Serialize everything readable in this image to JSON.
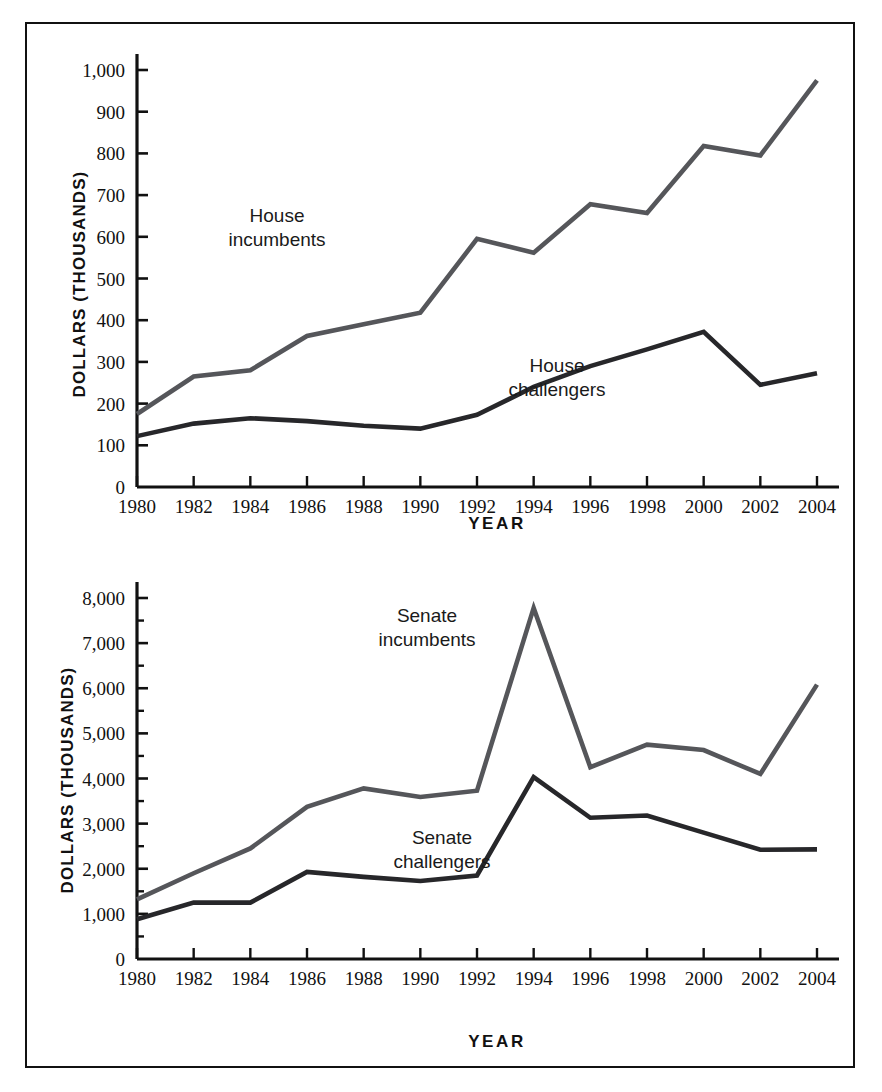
{
  "figure": {
    "background_color": "#ffffff",
    "frame_color": "#111111",
    "incumbent_color": "#55565a",
    "challenger_color": "#27272a"
  },
  "chart_data": [
    {
      "id": "house",
      "type": "line",
      "title": "",
      "xlabel": "YEAR",
      "ylabel": "DOLLARS (THOUSANDS)",
      "x": [
        1980,
        1982,
        1984,
        1986,
        1988,
        1990,
        1992,
        1994,
        1996,
        1998,
        2000,
        2002,
        2004
      ],
      "xticklabels": [
        "1980",
        "1982",
        "1984",
        "1986",
        "1988",
        "1990",
        "1992",
        "1994",
        "1996",
        "1998",
        "2000",
        "2002",
        "2004"
      ],
      "yticks": [
        0,
        100,
        200,
        300,
        400,
        500,
        600,
        700,
        800,
        900,
        1000
      ],
      "yticklabels": [
        "0",
        "100",
        "200",
        "300",
        "400",
        "500",
        "600",
        "700",
        "800",
        "900",
        "1,000"
      ],
      "ylim": [
        0,
        1000
      ],
      "xlim": [
        1980,
        2004
      ],
      "grid": false,
      "legend_position": "inline-annotation",
      "series": [
        {
          "name": "House incumbents",
          "color": "#55565a",
          "label_text": "House\nincumbents",
          "label_line1": "House",
          "label_line2": "incumbents",
          "values": [
            175,
            265,
            280,
            362,
            390,
            418,
            595,
            562,
            678,
            657,
            818,
            795,
            975
          ]
        },
        {
          "name": "House challengers",
          "color": "#27272a",
          "label_text": "House\nchallengers",
          "label_line1": "House",
          "label_line2": "challengers",
          "values": [
            122,
            152,
            165,
            158,
            147,
            140,
            173,
            240,
            290,
            330,
            372,
            245,
            273
          ]
        }
      ]
    },
    {
      "id": "senate",
      "type": "line",
      "title": "",
      "xlabel": "YEAR",
      "ylabel": "DOLLARS (THOUSANDS)",
      "x": [
        1980,
        1982,
        1984,
        1986,
        1988,
        1990,
        1992,
        1994,
        1996,
        1998,
        2000,
        2002,
        2004
      ],
      "xticklabels": [
        "1980",
        "1982",
        "1984",
        "1986",
        "1988",
        "1990",
        "1992",
        "1994",
        "1996",
        "1998",
        "2000",
        "2002",
        "2004"
      ],
      "yticks": [
        0,
        1000,
        2000,
        3000,
        4000,
        5000,
        6000,
        7000,
        8000
      ],
      "yticklabels": [
        "0",
        "1,000",
        "2,000",
        "3,000",
        "4,000",
        "5,000",
        "6,000",
        "7,000",
        "8,000"
      ],
      "yminorticks": [
        500,
        1500,
        2500,
        3500,
        4500,
        5500,
        6500,
        7500
      ],
      "ylim": [
        0,
        8000
      ],
      "xlim": [
        1980,
        2004
      ],
      "grid": false,
      "legend_position": "inline-annotation",
      "series": [
        {
          "name": "Senate incumbents",
          "color": "#55565a",
          "label_text": "Senate\nincumbents",
          "label_line1": "Senate",
          "label_line2": "incumbents",
          "values": [
            1320,
            1900,
            2450,
            3370,
            3780,
            3590,
            3730,
            7780,
            4250,
            4750,
            4630,
            4100,
            6080
          ]
        },
        {
          "name": "Senate challengers",
          "color": "#27272a",
          "label_text": "Senate\nchallengers",
          "label_line1": "Senate",
          "label_line2": "challengers",
          "values": [
            880,
            1250,
            1250,
            1930,
            1820,
            1730,
            1850,
            4030,
            3130,
            3180,
            2800,
            2420,
            2430
          ]
        }
      ]
    }
  ]
}
